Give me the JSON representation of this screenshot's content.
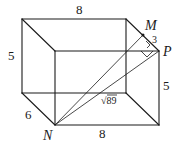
{
  "diagram": {
    "type": "rectangular-prism",
    "vertices": {
      "back_top_left": [
        22,
        19
      ],
      "back_top_right": [
        126,
        19
      ],
      "front_top_left": [
        55,
        51
      ],
      "P": [
        159,
        51
      ],
      "back_bottom_left": [
        22,
        93
      ],
      "back_bottom_right": [
        126,
        93
      ],
      "N": [
        55,
        125
      ],
      "front_bottom_right": [
        159,
        125
      ],
      "M": [
        143,
        35
      ]
    },
    "labels": {
      "top_length": "8",
      "left_height": "5",
      "depth": "6",
      "bottom_length": "8",
      "right_height": "5",
      "segment_MP": "3",
      "point_M": "M",
      "point_P": "P",
      "point_N": "N",
      "diagonal": "√89"
    }
  }
}
